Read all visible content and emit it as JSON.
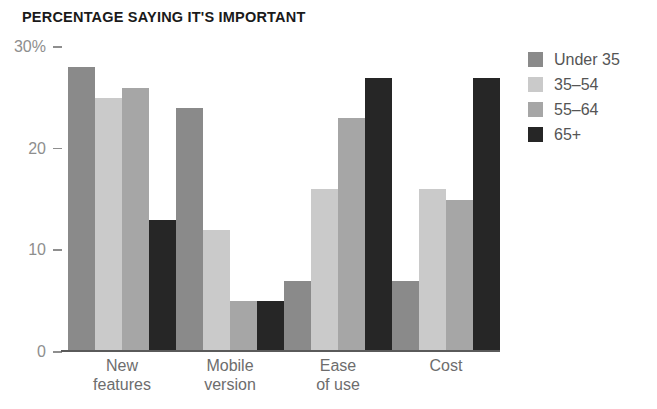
{
  "chart_data": {
    "type": "bar",
    "title": "PERCENTAGE SAYING IT'S IMPORTANT",
    "xlabel": "",
    "ylabel": "",
    "ylim": [
      0,
      30
    ],
    "grid": false,
    "legend_position": "right",
    "ytick_labels": [
      "30%",
      "20",
      "10",
      "0"
    ],
    "ytick_values": [
      30,
      20,
      10,
      0
    ],
    "categories": [
      "New features",
      "Mobile version",
      "Ease of use",
      "Cost"
    ],
    "category_lines": [
      [
        "New",
        "features"
      ],
      [
        "Mobile",
        "version"
      ],
      [
        "Ease",
        "of use"
      ],
      [
        "Cost",
        ""
      ]
    ],
    "series": [
      {
        "name": "Under 35",
        "color": "#8a8a8a",
        "values": [
          28,
          24,
          7,
          7
        ]
      },
      {
        "name": "35–54",
        "color": "#cacaca",
        "values": [
          25,
          12,
          16,
          16
        ]
      },
      {
        "name": "55–64",
        "color": "#a6a6a6",
        "values": [
          26,
          5,
          23,
          15
        ]
      },
      {
        "name": "65+",
        "color": "#262626",
        "values": [
          13,
          5,
          27,
          27
        ]
      }
    ]
  },
  "axis": {
    "tick_30": "30%",
    "tick_20": "20",
    "tick_10": "10",
    "tick_0": "0"
  },
  "legend": {
    "items": [
      {
        "label": "Under 35"
      },
      {
        "label": "35–54"
      },
      {
        "label": "55–64"
      },
      {
        "label": "65+"
      }
    ]
  }
}
